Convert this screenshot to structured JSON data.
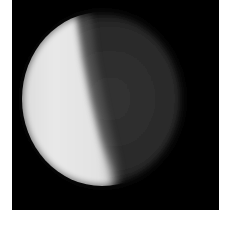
{
  "image": {
    "subject": "planetary disk showing illuminated phase",
    "description": "Grayscale telescope-style image of a spherical body; the left portion is brightly lit and the right portion is in dim shadow, separated by a soft near-vertical terminator, on a black background.",
    "colors": {
      "page_background": "#ffffff",
      "sky": "#000000",
      "lit_surface": "#e6e6e6",
      "dark_surface": "#2f2f2f"
    }
  }
}
